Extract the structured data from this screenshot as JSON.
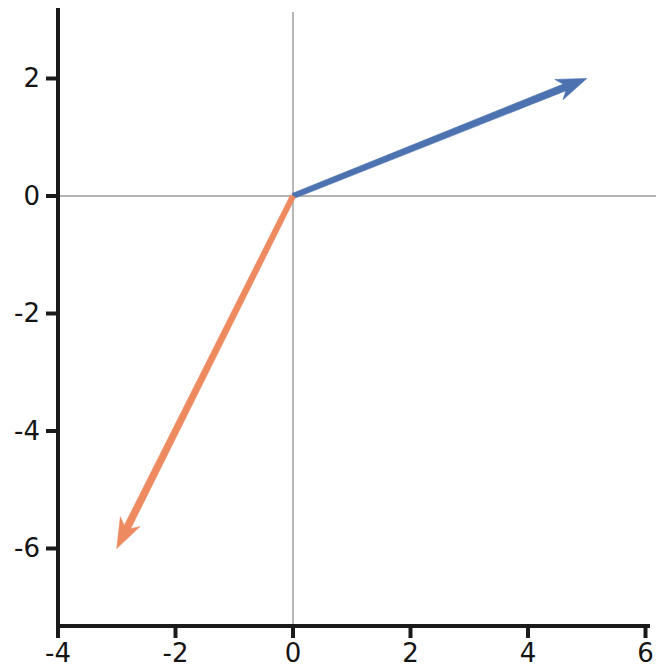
{
  "chart_data": {
    "type": "quiver",
    "title": "",
    "xlabel": "",
    "ylabel": "",
    "xlim": [
      -4,
      6
    ],
    "ylim": [
      -7.2,
      2.9
    ],
    "grid": false,
    "legend": null,
    "xticks": [
      "-4",
      "-2",
      "0",
      "2",
      "4",
      "6"
    ],
    "xtick_values": [
      -4,
      -2,
      0,
      2,
      4,
      6
    ],
    "yticks": [
      "2",
      "0",
      "-2",
      "-4",
      "-6"
    ],
    "ytick_values": [
      2,
      0,
      -2,
      -4,
      -6
    ],
    "zero_lines": {
      "horizontal": 0,
      "vertical": 0,
      "color": "#9a9a9a"
    },
    "vectors": [
      {
        "name": "blue-vector",
        "origin": [
          0,
          0
        ],
        "components": [
          5,
          2
        ],
        "tip": [
          5,
          2
        ],
        "color": "#4c72b0",
        "label": ""
      },
      {
        "name": "orange-vector",
        "origin": [
          0,
          0
        ],
        "components": [
          -3,
          -6
        ],
        "tip": [
          -3,
          -6
        ],
        "color": "#ee8a60",
        "label": ""
      }
    ]
  },
  "axes": {
    "x_axis_name": "x-axis",
    "y_axis_name": "y-axis"
  },
  "colors": {
    "blue": "#4c72b0",
    "orange": "#ee8a60",
    "axis": "#1a1a1a",
    "zeroline": "#9a9a9a",
    "background": "#ffffff"
  }
}
